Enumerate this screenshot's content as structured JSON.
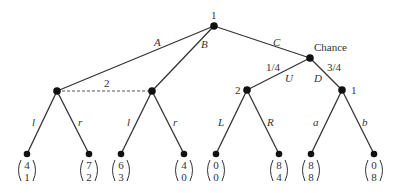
{
  "diagram": {
    "type": "extensive-form game tree",
    "nodes": {
      "root": {
        "label": "1",
        "x": 214,
        "y": 26
      },
      "p2_left": {
        "x": 57,
        "y": 91
      },
      "p2_mid": {
        "x": 152,
        "y": 91
      },
      "chance": {
        "label": "Chance",
        "x": 310,
        "y": 58
      },
      "p2_U": {
        "label": "2",
        "x": 247,
        "y": 90
      },
      "p1_D": {
        "label": "1",
        "x": 342,
        "y": 90
      }
    },
    "info_set_label": "2",
    "edges": {
      "A": "A",
      "B": "B",
      "C": "C",
      "U": "U",
      "D": "D",
      "prob_U": "1/4",
      "prob_D": "3/4",
      "l1": "l",
      "r1": "r",
      "l2": "l",
      "r2": "r",
      "L": "L",
      "R": "R",
      "a": "a",
      "b": "b"
    },
    "payoffs": [
      {
        "top": "4",
        "bottom": "1"
      },
      {
        "top": "7",
        "bottom": "2"
      },
      {
        "top": "6",
        "bottom": "3"
      },
      {
        "top": "4",
        "bottom": "0"
      },
      {
        "top": "0",
        "bottom": "0"
      },
      {
        "top": "8",
        "bottom": "4"
      },
      {
        "top": "8",
        "bottom": "8"
      },
      {
        "top": "0",
        "bottom": "8"
      }
    ]
  }
}
